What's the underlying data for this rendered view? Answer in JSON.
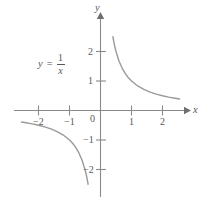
{
  "figure": {
    "background_color": "#ffffff",
    "axis_color": "#8a8a8a",
    "curve_color": "#9a9a9a",
    "text_color": "#58585a"
  },
  "equation": {
    "lhs": "y",
    "operator": "=",
    "numerator": "1",
    "denominator": "x"
  },
  "axes": {
    "x_name": "x",
    "y_name": "y",
    "origin_label": "0"
  },
  "x_ticks": [
    {
      "label": "−2",
      "value": -2
    },
    {
      "label": "−1",
      "value": -1
    },
    {
      "label": "1",
      "value": 1
    },
    {
      "label": "2",
      "value": 2
    }
  ],
  "y_ticks": [
    {
      "label": "2",
      "value": 2
    },
    {
      "label": "1",
      "value": 1
    },
    {
      "label": "−1",
      "value": -1
    },
    {
      "label": "−2",
      "value": -2
    }
  ],
  "chart_data": {
    "type": "line",
    "xlabel": "x",
    "ylabel": "y",
    "xlim": [
      -2.75,
      2.75
    ],
    "ylim": [
      -2.75,
      2.75
    ],
    "grid": false,
    "legend": false,
    "annotations": [
      {
        "text": "y = 1/x",
        "x": -1.9,
        "y": 1.75
      }
    ],
    "series": [
      {
        "name": "branch-positive",
        "function": "y = 1/x",
        "x": [
          0.4,
          0.45,
          0.5,
          0.6,
          0.7,
          0.8,
          0.9,
          1.0,
          1.2,
          1.4,
          1.6,
          1.8,
          2.0,
          2.2,
          2.4,
          2.55
        ],
        "values": [
          2.5,
          2.22,
          2.0,
          1.667,
          1.429,
          1.25,
          1.111,
          1.0,
          0.833,
          0.714,
          0.625,
          0.556,
          0.5,
          0.455,
          0.417,
          0.392
        ]
      },
      {
        "name": "branch-negative",
        "function": "y = 1/x",
        "x": [
          -2.55,
          -2.4,
          -2.2,
          -2.0,
          -1.8,
          -1.6,
          -1.4,
          -1.2,
          -1.0,
          -0.9,
          -0.8,
          -0.7,
          -0.6,
          -0.5,
          -0.45,
          -0.4
        ],
        "values": [
          -0.392,
          -0.417,
          -0.455,
          -0.5,
          -0.556,
          -0.625,
          -0.714,
          -0.833,
          -1.0,
          -1.111,
          -1.25,
          -1.429,
          -1.667,
          -2.0,
          -2.22,
          -2.5
        ]
      }
    ]
  }
}
